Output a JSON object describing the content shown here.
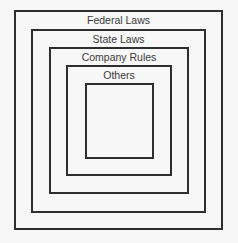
{
  "diagram": {
    "type": "nested-squares",
    "levels": [
      {
        "label": "Federal Laws"
      },
      {
        "label": "State Laws"
      },
      {
        "label": "Company Rules"
      },
      {
        "label": "Others"
      },
      {
        "label": ""
      }
    ]
  }
}
